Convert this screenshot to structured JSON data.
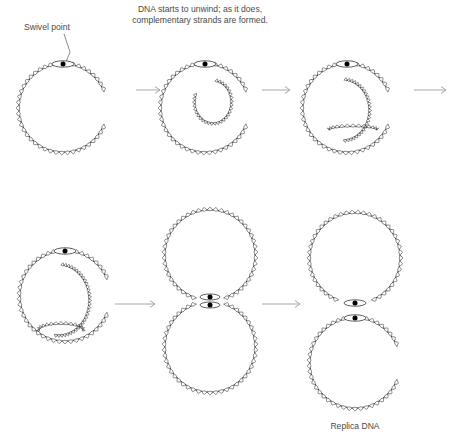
{
  "figure": {
    "title_caption": "DNA starts to unwind; as it does,\ncomplementary strands are formed.",
    "caption_line_1": "DNA starts to unwind; as it does,",
    "caption_line_2": "complementary strands are formed.",
    "swivel_label": "Swivel point",
    "replica_label": "Replica DNA",
    "background_color": "#ffffff",
    "strand_color": "#3a3a3a",
    "dot_color": "#000000",
    "text_color": "#4a4a4a",
    "arrow_color": "#a8a8a8"
  },
  "chart_data": {
    "type": "diagram",
    "stages": [
      {
        "index": 1,
        "name": "intact-circular-dna",
        "row": "top",
        "description": "Intact circular double-stranded DNA with a single swivel point at the top",
        "center": [
          63,
          108
        ],
        "radius": 44,
        "swivel_points": 1,
        "inner_loop": false,
        "label": "Swivel point"
      },
      {
        "index": 2,
        "name": "unwinding-begins",
        "row": "top",
        "description": "DNA starts to unwind at the swivel point; a small inner replication loop appears",
        "center": [
          205,
          108
        ],
        "radius": 44,
        "swivel_points": 1,
        "inner_loop": true,
        "inner_loop_size": "small",
        "label": "DNA starts to unwind; as it does, complementary strands are formed."
      },
      {
        "index": 3,
        "name": "loop-expands",
        "row": "top",
        "description": "The replication loop expands; complementary strands extend across the circle",
        "center": [
          347,
          108
        ],
        "radius": 44,
        "swivel_points": 1,
        "inner_loop": true,
        "inner_loop_size": "medium",
        "label": ""
      },
      {
        "index": 4,
        "name": "loop-nearly-complete",
        "row": "bottom",
        "description": "Inner replicated loop grows to nearly the size of the parent circle",
        "center": [
          65,
          296
        ],
        "radius": 45,
        "swivel_points": 1,
        "inner_loop": true,
        "inner_loop_size": "large",
        "label": ""
      },
      {
        "index": 5,
        "name": "figure-eight-intermediate",
        "row": "bottom",
        "description": "Two daughter circles joined at a junction with two swivel points, forming a figure eight",
        "upper_center": [
          210,
          255
        ],
        "lower_center": [
          210,
          347
        ],
        "radius": 45,
        "swivel_points": 2,
        "inner_loop": false,
        "label": ""
      },
      {
        "index": 6,
        "name": "separated-replica-dna",
        "row": "bottom",
        "description": "Two separate identical daughter circles, each with its own swivel point",
        "upper_center": [
          355,
          258
        ],
        "lower_center": [
          355,
          363
        ],
        "radius": 45,
        "swivel_points": 2,
        "inner_loop": false,
        "label": "Replica DNA"
      }
    ],
    "arrows": [
      {
        "name": "arrow-stage1-to-stage2",
        "from": 1,
        "to": 2,
        "x1": 136,
        "y1": 90,
        "x2": 160,
        "y2": 90,
        "direction": "right"
      },
      {
        "name": "arrow-stage2-to-stage3",
        "from": 2,
        "to": 3,
        "x1": 262,
        "y1": 90,
        "x2": 290,
        "y2": 90,
        "direction": "right"
      },
      {
        "name": "arrow-stage3-to-stage4",
        "from": 3,
        "to": 4,
        "x1": 414,
        "y1": 90,
        "x2": 446,
        "y2": 90,
        "direction": "right"
      },
      {
        "name": "arrow-stage4-to-stage5",
        "from": 4,
        "to": 5,
        "x1": 115,
        "y1": 304,
        "x2": 155,
        "y2": 304,
        "direction": "right"
      },
      {
        "name": "arrow-stage5-to-stage6",
        "from": 5,
        "to": 6,
        "x1": 262,
        "y1": 304,
        "x2": 300,
        "y2": 304,
        "direction": "right"
      }
    ],
    "annotations": [
      {
        "name": "swivel-point-annotation",
        "text": "Swivel point",
        "x": 24,
        "y": 28,
        "leader_to": [
          65,
          64
        ]
      },
      {
        "name": "unwind-caption",
        "text": "DNA starts to unwind; as it does, complementary strands are formed.",
        "x": 200,
        "y": 9
      },
      {
        "name": "replica-dna-label",
        "text": "Replica DNA",
        "x": 330,
        "y": 427
      }
    ],
    "legend": [],
    "grid": false
  }
}
